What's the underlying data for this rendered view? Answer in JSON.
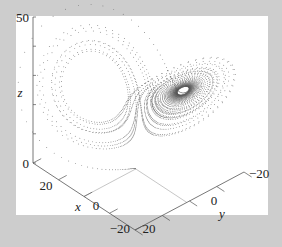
{
  "chart_data": {
    "type": "scatter",
    "subtype": "3d-trajectory",
    "title": "",
    "system": {
      "name": "Lorenz",
      "sigma": 10,
      "rho": 28,
      "beta": 2.6667,
      "initial_point": [
        0,
        1,
        0
      ]
    },
    "axes": {
      "x": {
        "label": "x",
        "range": [
          -20,
          20
        ],
        "ticks": [
          20,
          0,
          -20
        ],
        "tick_labels": [
          "20",
          "0",
          "−20"
        ]
      },
      "y": {
        "label": "y",
        "range": [
          -20,
          20
        ],
        "ticks": [
          20,
          0,
          -20
        ],
        "tick_labels": [
          "20",
          "0",
          "−20"
        ]
      },
      "z": {
        "label": "z",
        "range": [
          0,
          50
        ],
        "ticks": [
          0,
          50
        ],
        "tick_labels": [
          "0",
          "50"
        ]
      }
    },
    "grid": false,
    "legend": "none",
    "colors": {
      "background": "#cdcdcd",
      "plot_area": "#ffffff",
      "axis": "#555555",
      "guide_lines": "#b8b8b8",
      "points": "#555555"
    }
  }
}
